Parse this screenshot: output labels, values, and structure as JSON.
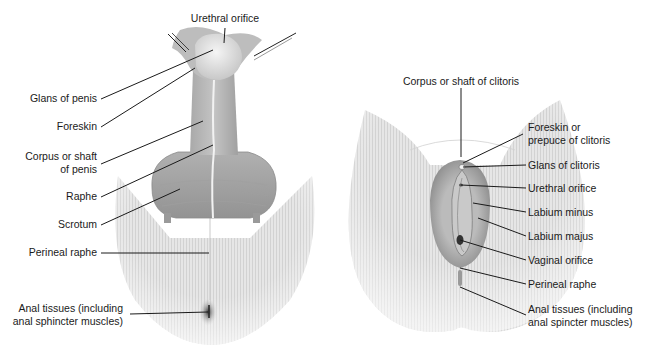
{
  "figure": {
    "colors": {
      "background": "#ffffff",
      "skin_light": "#e9e9e9",
      "skin_mid": "#bdbdbd",
      "skin_dark": "#8f8f8f",
      "leader_line": "#1a1a1a",
      "label_text": "#1a1a1a"
    },
    "male": {
      "labels": {
        "urethral_orifice": "Urethral orifice",
        "glans_of_penis": "Glans of penis",
        "foreskin": "Foreskin",
        "corpus_line1": "Corpus or shaft",
        "corpus_line2": "of penis",
        "raphe": "Raphe",
        "scrotum": "Scrotum",
        "perineal_raphe": "Perineal raphe",
        "anal_line1": "Anal tissues (including",
        "anal_line2": "anal sphincter muscles)"
      }
    },
    "female": {
      "labels": {
        "corpus_of_clitoris": "Corpus or shaft of clitoris",
        "prepuce_line1": "Foreskin or",
        "prepuce_line2": "prepuce of clitoris",
        "glans_of_clitoris": "Glans of clitoris",
        "urethral_orifice": "Urethral orifice",
        "labium_minus": "Labium minus",
        "labium_majus": "Labium majus",
        "vaginal_orifice": "Vaginal orifice",
        "perineal_raphe": "Perineal raphe",
        "anal_line1": "Anal tissues (including",
        "anal_line2": "anal spincter muscles)"
      }
    }
  }
}
